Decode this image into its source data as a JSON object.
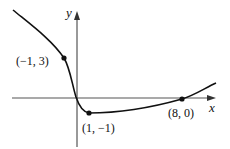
{
  "figure": {
    "axes": {
      "x_label": "x",
      "y_label": "y"
    },
    "points": [
      {
        "label": "(−1, 3)",
        "x": -1,
        "y": 3
      },
      {
        "label": "(1, −1)",
        "x": 1,
        "y": -1
      },
      {
        "label": "(8, 0)",
        "x": 8,
        "y": 0
      }
    ],
    "colors": {
      "curve": "#111111",
      "axes": "#555555",
      "background": "#ffffff"
    }
  }
}
